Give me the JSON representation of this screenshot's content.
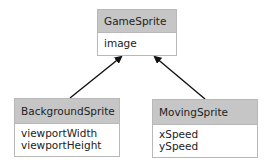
{
  "diagram": {
    "type": "uml-class-inheritance",
    "classes": [
      {
        "id": "game",
        "name": "GameSprite",
        "attributes": [
          "image"
        ]
      },
      {
        "id": "background",
        "name": "BackgroundSprite",
        "attributes": [
          "viewportWidth",
          "viewportHeight"
        ]
      },
      {
        "id": "moving",
        "name": "MovingSprite",
        "attributes": [
          "xSpeed",
          "ySpeed"
        ]
      }
    ],
    "relations": [
      {
        "from": "BackgroundSprite",
        "to": "GameSprite",
        "type": "inherits"
      },
      {
        "from": "MovingSprite",
        "to": "GameSprite",
        "type": "inherits"
      }
    ],
    "colors": {
      "header": "#c6c6c6",
      "border": "#b8b8b8",
      "arrow": "#111111"
    }
  }
}
